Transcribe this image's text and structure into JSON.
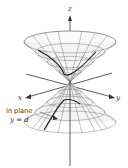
{
  "figure": {
    "axes": {
      "z": "z",
      "x": "x",
      "y": "y"
    },
    "annotation": {
      "line1": "In plane",
      "line2": "y = d"
    },
    "colors": {
      "mesh": "#555555",
      "axis": "#333333",
      "curve": "#222222",
      "background": "#ffffff"
    }
  }
}
